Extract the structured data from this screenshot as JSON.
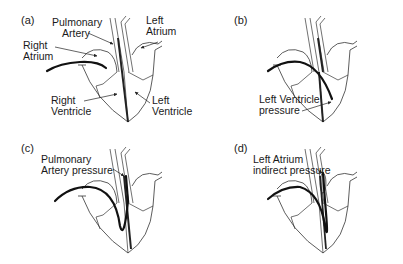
{
  "diagram": {
    "panels": [
      {
        "tag": "(a)",
        "labels": {
          "pulmonary_artery": [
            "Pulmonary",
            "Artery"
          ],
          "left_atrium": [
            "Left",
            "Atrium"
          ],
          "right_atrium": [
            "Right",
            "Atrium"
          ],
          "right_ventricle": [
            "Right",
            "Ventricle"
          ],
          "left_ventricle": [
            "Left",
            "Ventricle"
          ]
        }
      },
      {
        "tag": "(b)",
        "labels": {
          "measurement": [
            "Left Ventricle",
            "pressure"
          ]
        }
      },
      {
        "tag": "(c)",
        "labels": {
          "measurement": [
            "Pulmonary",
            "Artery pressure"
          ]
        }
      },
      {
        "tag": "(d)",
        "labels": {
          "measurement": [
            "Left Atrium",
            "indirect pressure"
          ]
        }
      }
    ],
    "colors": {
      "line": "#222222",
      "catheter": "#111111",
      "balloon": "#bbbbbb",
      "background": "#ffffff"
    }
  }
}
